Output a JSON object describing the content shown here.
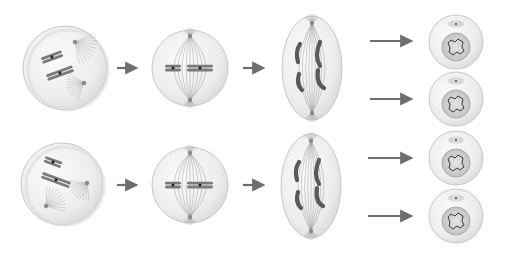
{
  "diagram": {
    "type": "cell-division-sequence",
    "rows": [
      {
        "id": "row-1",
        "stages": [
          {
            "stage": "prophase",
            "shape": "circle",
            "cx": 65,
            "cy": 68,
            "r": 42,
            "chromosomes": 2,
            "centrosomes": 2
          },
          {
            "stage": "metaphase",
            "shape": "circle",
            "cx": 190,
            "cy": 68,
            "r": 38,
            "chromosomes": 2,
            "alignment": "equatorial"
          },
          {
            "stage": "anaphase",
            "shape": "ellipse",
            "cx": 312,
            "cy": 68,
            "rx": 30,
            "ry": 52,
            "chromatids": 4
          },
          {
            "stage": "daughter-cell",
            "shape": "circle",
            "cx": 456,
            "cy": 42,
            "r": 27,
            "nucleus": true
          },
          {
            "stage": "daughter-cell",
            "shape": "circle",
            "cx": 456,
            "cy": 99,
            "r": 27,
            "nucleus": true
          }
        ],
        "arrows": [
          {
            "x1": 117,
            "y1": 68,
            "x2": 135,
            "y2": 68
          },
          {
            "x1": 243,
            "y1": 68,
            "x2": 262,
            "y2": 68
          },
          {
            "x1": 370,
            "y1": 41,
            "x2": 410,
            "y2": 41
          },
          {
            "x1": 370,
            "y1": 99,
            "x2": 410,
            "y2": 99
          }
        ]
      },
      {
        "id": "row-2",
        "stages": [
          {
            "stage": "prophase",
            "shape": "circle",
            "cx": 62,
            "cy": 184,
            "r": 41,
            "chromosomes": 2,
            "centrosomes": 2
          },
          {
            "stage": "metaphase",
            "shape": "circle",
            "cx": 190,
            "cy": 185,
            "r": 38,
            "chromosomes": 2,
            "alignment": "equatorial"
          },
          {
            "stage": "anaphase",
            "shape": "ellipse",
            "cx": 311,
            "cy": 186,
            "rx": 30,
            "ry": 52,
            "chromatids": 4
          },
          {
            "stage": "daughter-cell",
            "shape": "circle",
            "cx": 456,
            "cy": 158,
            "r": 27,
            "nucleus": true
          },
          {
            "stage": "daughter-cell",
            "shape": "circle",
            "cx": 456,
            "cy": 216,
            "r": 27,
            "nucleus": true
          }
        ],
        "arrows": [
          {
            "x1": 117,
            "y1": 185,
            "x2": 135,
            "y2": 185
          },
          {
            "x1": 243,
            "y1": 185,
            "x2": 262,
            "y2": 185
          },
          {
            "x1": 368,
            "y1": 158,
            "x2": 410,
            "y2": 158
          },
          {
            "x1": 368,
            "y1": 216,
            "x2": 410,
            "y2": 216
          }
        ]
      }
    ],
    "colors": {
      "background": "#ffffff",
      "cell_fill": "#ececec",
      "cell_outline": "#c8c8c8",
      "chromosome": "#7a7a7a",
      "spindle": "#9a9a9a",
      "arrow": "#6e6e6e",
      "nucleus_fill": "#d2d2d2",
      "chromatin": "#3a3a3a"
    }
  }
}
